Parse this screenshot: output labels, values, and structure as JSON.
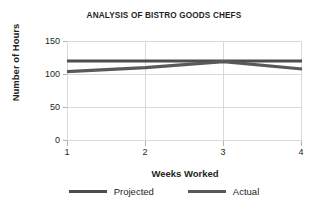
{
  "chart_data": {
    "type": "line",
    "title": "ANALYSIS OF BISTRO GOODS CHEFS",
    "xlabel": "Weeks Worked",
    "ylabel": "Number of Hours",
    "x": [
      1,
      2,
      3,
      4
    ],
    "xticklabels": [
      "1",
      "2",
      "3",
      "4"
    ],
    "yticklabels": [
      "0",
      "50",
      "100",
      "150"
    ],
    "yticks": [
      0,
      50,
      100,
      150
    ],
    "ylim": [
      0,
      150
    ],
    "xlim": [
      1,
      4
    ],
    "grid": "both-light",
    "legend_position": "bottom-center",
    "series": [
      {
        "name": "Projected",
        "values": [
          120,
          120,
          120,
          120
        ],
        "color": "#4d4d4d"
      },
      {
        "name": "Actual",
        "values": [
          104,
          110,
          119,
          108
        ],
        "color": "#595959"
      }
    ]
  },
  "legend": {
    "items": [
      {
        "label": "Projected",
        "color": "#4d4d4d"
      },
      {
        "label": "Actual",
        "color": "#595959"
      }
    ]
  },
  "colors": {
    "background": "#ffffff",
    "text": "#231f20",
    "gridline": "#d9d9d9",
    "tickmark": "#b3b3b3",
    "projected_line": "#4d4d4d",
    "actual_line": "#595959"
  }
}
